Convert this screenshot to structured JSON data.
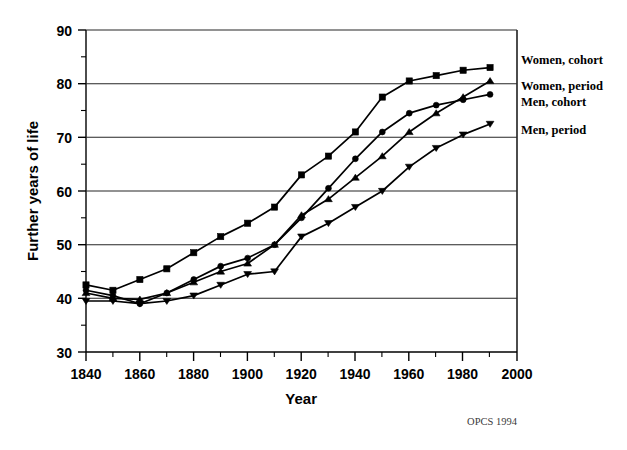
{
  "chart_data": {
    "type": "line",
    "title": "",
    "xlabel": "Year",
    "ylabel": "Further years of life",
    "xlim": [
      1840,
      2000
    ],
    "ylim": [
      30,
      90
    ],
    "xticks": [
      1840,
      1860,
      1880,
      1900,
      1920,
      1940,
      1960,
      1980,
      2000
    ],
    "xtick_labels": [
      "1840",
      "1860",
      "1880",
      "1900",
      "1920",
      "1940",
      "1960",
      "1980",
      "2000"
    ],
    "xminor_ticks": [
      1850,
      1870,
      1890,
      1910,
      1930,
      1950,
      1970,
      1990
    ],
    "yticks": [
      30,
      40,
      50,
      60,
      70,
      80,
      90
    ],
    "ytick_labels": [
      "30",
      "40",
      "50",
      "60",
      "70",
      "80",
      "90"
    ],
    "yminor_ticks": [
      35,
      45,
      55,
      65,
      75,
      85
    ],
    "grid": true,
    "grid_axis": "y",
    "legend_position": "right-outside",
    "x": [
      1840,
      1850,
      1860,
      1870,
      1880,
      1890,
      1900,
      1910,
      1920,
      1930,
      1940,
      1950,
      1960,
      1970,
      1980,
      1990
    ],
    "series": [
      {
        "name": "Women, cohort",
        "marker": "square",
        "values": [
          42.5,
          41.5,
          43.5,
          45.5,
          48.5,
          51.5,
          54.0,
          57.0,
          63.0,
          66.5,
          71.0,
          77.5,
          80.5,
          81.5,
          82.5,
          83.0
        ]
      },
      {
        "name": "Women, period",
        "marker": "triangle",
        "values": [
          41.0,
          40.0,
          39.8,
          41.0,
          43.0,
          45.0,
          46.5,
          50.0,
          55.5,
          58.5,
          62.5,
          66.5,
          71.0,
          74.5,
          77.5,
          80.5
        ]
      },
      {
        "name": "Men, cohort",
        "marker": "circle",
        "values": [
          41.5,
          40.5,
          39.0,
          41.0,
          43.5,
          46.0,
          47.5,
          50.0,
          55.0,
          60.5,
          66.0,
          71.0,
          74.5,
          76.0,
          77.0,
          78.0
        ]
      },
      {
        "name": "Men, period",
        "marker": "triangle-down",
        "values": [
          39.5,
          39.5,
          39.0,
          39.5,
          40.5,
          42.5,
          44.5,
          45.0,
          51.5,
          54.0,
          57.0,
          60.0,
          64.5,
          68.0,
          70.5,
          72.5
        ]
      }
    ],
    "annotations": [
      {
        "name": "source-credit",
        "text": "OPCS 1994"
      }
    ]
  },
  "legend": {
    "items": [
      {
        "label": "Women, cohort"
      },
      {
        "label": "Women, period"
      },
      {
        "label": "Men, cohort"
      },
      {
        "label": "Men, period"
      }
    ]
  },
  "footer": {
    "source": "OPCS 1994"
  }
}
